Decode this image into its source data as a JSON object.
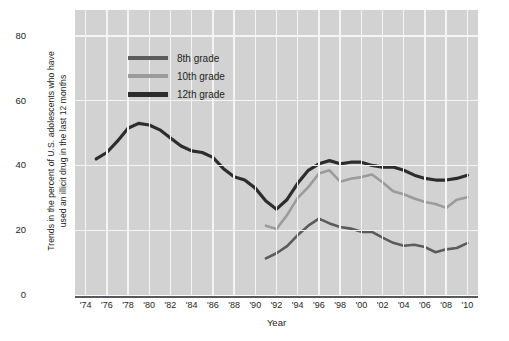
{
  "chart_data": {
    "type": "line",
    "title": "",
    "xlabel": "Year",
    "ylabel_line1": "Trends in the percent of U.S. adolescents  who have",
    "ylabel_line2": "used an illicit drug in the last 12 months",
    "ylim": [
      0,
      88
    ],
    "xlim": [
      1973,
      2011
    ],
    "yticks": [
      0,
      20,
      40,
      60,
      80
    ],
    "xticks": [
      "'74",
      "'76",
      "'78",
      "'80",
      "'82",
      "'84",
      "'86",
      "'88",
      "'90",
      "'92",
      "'94",
      "'96",
      "'98",
      "'00",
      "'02",
      "'04",
      "'06",
      "'08",
      "'10"
    ],
    "xtick_years": [
      1974,
      1976,
      1978,
      1980,
      1982,
      1984,
      1986,
      1988,
      1990,
      1992,
      1994,
      1996,
      1998,
      2000,
      2002,
      2004,
      2006,
      2008,
      2010
    ],
    "grid": true,
    "grid_color": "#f4f4f4",
    "plot_background": "#d2d2d2",
    "legend_position": "upper-center-left",
    "series": [
      {
        "name": "8th grade",
        "color": "#5b5b5b",
        "x": [
          1991,
          1992,
          1993,
          1994,
          1995,
          1996,
          1997,
          1998,
          1999,
          2000,
          2001,
          2002,
          2003,
          2004,
          2005,
          2006,
          2007,
          2008,
          2009,
          2010
        ],
        "values": [
          11.3,
          12.9,
          15.1,
          18.5,
          21.4,
          23.6,
          22.1,
          21.0,
          20.5,
          19.5,
          19.5,
          17.7,
          16.1,
          15.2,
          15.5,
          14.8,
          13.2,
          14.1,
          14.5,
          16.0
        ]
      },
      {
        "name": "10th grade",
        "color": "#9b9b9b",
        "x": [
          1991,
          1992,
          1993,
          1994,
          1995,
          1996,
          1997,
          1998,
          1999,
          2000,
          2001,
          2002,
          2003,
          2004,
          2005,
          2006,
          2007,
          2008,
          2009,
          2010
        ],
        "values": [
          21.4,
          20.4,
          24.7,
          30.0,
          33.3,
          37.5,
          38.5,
          35.0,
          35.9,
          36.4,
          37.2,
          34.8,
          32.0,
          31.1,
          29.8,
          28.7,
          28.1,
          26.9,
          29.4,
          30.2
        ]
      },
      {
        "name": "12th grade",
        "color": "#2d2d2d",
        "x": [
          1975,
          1976,
          1977,
          1978,
          1979,
          1980,
          1981,
          1982,
          1983,
          1984,
          1985,
          1986,
          1987,
          1988,
          1989,
          1990,
          1991,
          1992,
          1993,
          1994,
          1995,
          1996,
          1997,
          1998,
          1999,
          2000,
          2001,
          2002,
          2003,
          2004,
          2005,
          2006,
          2007,
          2008,
          2009,
          2010
        ],
        "values": [
          42.0,
          44.0,
          47.5,
          51.5,
          53.0,
          52.5,
          51.0,
          48.5,
          46.0,
          44.5,
          44.0,
          42.5,
          39.0,
          36.5,
          35.5,
          33.0,
          29.0,
          26.5,
          29.5,
          34.5,
          38.5,
          40.5,
          41.5,
          40.5,
          41.0,
          41.0,
          40.0,
          39.5,
          39.5,
          38.5,
          37.0,
          36.0,
          35.5,
          35.5,
          36.0,
          37.0
        ]
      }
    ]
  },
  "legend": {
    "entries": [
      {
        "label": "8th grade",
        "color": "#5b5b5b"
      },
      {
        "label": "10th grade",
        "color": "#9b9b9b"
      },
      {
        "label": "12th grade",
        "color": "#2d2d2d"
      }
    ]
  }
}
